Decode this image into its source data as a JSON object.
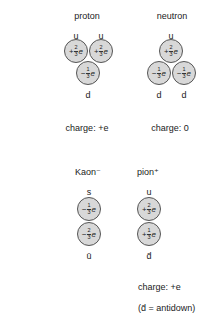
{
  "corner_fragment": "pa",
  "particles": [
    {
      "name": "proton",
      "charge_label": "charge: +e",
      "quarks": [
        {
          "flavor": "u",
          "sign": "+",
          "num": "2",
          "den": "3",
          "unit": "e"
        },
        {
          "flavor": "u",
          "sign": "+",
          "num": "2",
          "den": "3",
          "unit": "e"
        },
        {
          "flavor": "d",
          "sign": "−",
          "num": "1",
          "den": "3",
          "unit": "e"
        }
      ]
    },
    {
      "name": "neutron",
      "charge_label": "charge: 0",
      "quarks": [
        {
          "flavor": "u",
          "sign": "+",
          "num": "2",
          "den": "3",
          "unit": "e"
        },
        {
          "flavor": "d",
          "sign": "−",
          "num": "1",
          "den": "3",
          "unit": "e"
        },
        {
          "flavor": "d",
          "sign": "−",
          "num": "1",
          "den": "3",
          "unit": "e"
        }
      ]
    },
    {
      "name": "Kaon⁻",
      "charge_label": "",
      "quarks": [
        {
          "flavor": "s",
          "sign": "−",
          "num": "1",
          "den": "3",
          "unit": "e"
        },
        {
          "flavor": "ū",
          "sign": "−",
          "num": "2",
          "den": "3",
          "unit": "e"
        }
      ]
    },
    {
      "name": "pion⁺",
      "charge_label": "charge: +e",
      "quarks": [
        {
          "flavor": "u",
          "sign": "+",
          "num": "2",
          "den": "3",
          "unit": "e"
        },
        {
          "flavor": "d̄",
          "sign": "+",
          "num": "1",
          "den": "3",
          "unit": "e"
        }
      ]
    }
  ],
  "footnote": "(d̄ = antidown)",
  "colors": {
    "quark_fill": "#d8d8d8",
    "quark_stroke": "#555555",
    "text": "#222222"
  }
}
